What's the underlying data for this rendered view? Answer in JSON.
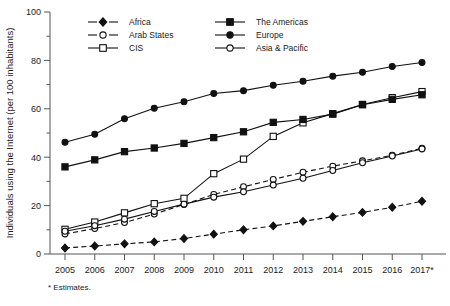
{
  "chart_data": {
    "type": "line",
    "title": "",
    "xlabel": "",
    "ylabel": "Individuals using the Internet (per 100 inhabitants)",
    "ylim": [
      0,
      100
    ],
    "yticks": [
      0,
      20,
      40,
      60,
      80,
      100
    ],
    "grid": false,
    "legend_position": "top-left-inside",
    "footnote": "* Estimates.",
    "categories": [
      "2005",
      "2006",
      "2007",
      "2008",
      "2009",
      "2010",
      "2011",
      "2012",
      "2013",
      "2014",
      "2015",
      "2016",
      "2017*"
    ],
    "series": [
      {
        "name": "Africa",
        "marker": "filled-diamond",
        "linestyle": "dashed",
        "color": "#111111",
        "values": [
          2.5,
          3.3,
          4.2,
          5.0,
          6.4,
          8.2,
          10.0,
          11.6,
          13.5,
          15.4,
          17.2,
          19.3,
          21.8
        ]
      },
      {
        "name": "Arab States",
        "marker": "open-circle",
        "linestyle": "dashed",
        "color": "#111111",
        "values": [
          8.3,
          10.5,
          13.0,
          16.5,
          20.5,
          24.6,
          27.8,
          30.8,
          33.8,
          36.3,
          38.5,
          40.8,
          43.7
        ]
      },
      {
        "name": "CIS",
        "marker": "open-square",
        "linestyle": "solid",
        "color": "#111111",
        "values": [
          10.2,
          13.2,
          17.0,
          20.8,
          23.0,
          33.2,
          39.2,
          48.6,
          54.2,
          58.0,
          61.8,
          64.6,
          67.1
        ]
      },
      {
        "name": "The Americas",
        "marker": "filled-square",
        "linestyle": "solid",
        "color": "#111111",
        "values": [
          36.0,
          38.9,
          42.3,
          43.8,
          45.7,
          48.1,
          50.5,
          54.4,
          55.6,
          57.8,
          61.7,
          63.9,
          65.8
        ]
      },
      {
        "name": "Europe",
        "marker": "filled-circle",
        "linestyle": "solid",
        "color": "#111111",
        "values": [
          46.2,
          49.5,
          55.9,
          60.2,
          62.9,
          66.3,
          67.5,
          69.7,
          71.4,
          73.5,
          75.1,
          77.5,
          79.1
        ]
      },
      {
        "name": "Asia & Pacific",
        "marker": "open-circle",
        "linestyle": "solid",
        "color": "#111111",
        "values": [
          9.4,
          11.7,
          14.4,
          17.6,
          20.6,
          23.5,
          25.7,
          28.5,
          31.3,
          34.5,
          37.7,
          40.5,
          43.4
        ]
      }
    ]
  },
  "axis": {
    "y_title": "Individuals using the Internet (per 100 inhabitants)",
    "y_tick_labels": [
      "0",
      "20",
      "40",
      "60",
      "80",
      "100"
    ],
    "x_tick_labels": [
      "2005",
      "2006",
      "2007",
      "2008",
      "2009",
      "2010",
      "2011",
      "2012",
      "2013",
      "2014",
      "2015",
      "2016",
      "2017*"
    ]
  },
  "legend": {
    "entries": [
      {
        "label": "Africa",
        "marker": "filled-diamond",
        "linestyle": "dashed"
      },
      {
        "label": "The Americas",
        "marker": "filled-square",
        "linestyle": "solid"
      },
      {
        "label": "Arab States",
        "marker": "open-circle",
        "linestyle": "dashed"
      },
      {
        "label": "Europe",
        "marker": "filled-circle",
        "linestyle": "solid"
      },
      {
        "label": "CIS",
        "marker": "open-square",
        "linestyle": "solid"
      },
      {
        "label": "Asia & Pacific",
        "marker": "open-circle",
        "linestyle": "solid"
      }
    ]
  },
  "footnote": {
    "text": "* Estimates."
  }
}
